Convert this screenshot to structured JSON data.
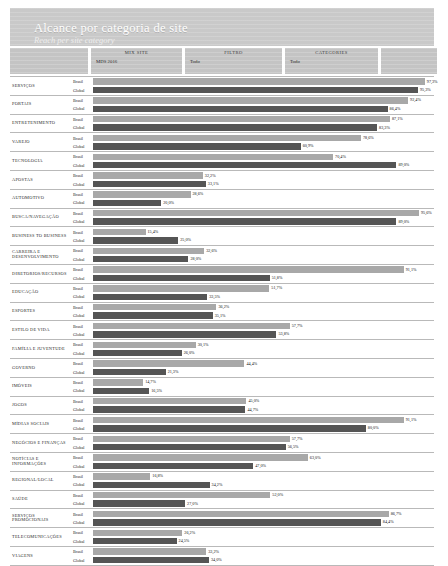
{
  "header": {
    "title": "Alcance por categoria de site",
    "subtitle": "Reach per site category"
  },
  "filters": [
    {
      "label": "",
      "value": ""
    },
    {
      "label": "MIX Site",
      "value": "MDS 2016"
    },
    {
      "label": "FILTRO",
      "value": "Todo"
    },
    {
      "label": "CATEGORIES",
      "value": "Todo"
    },
    {
      "label": "",
      "value": ""
    }
  ],
  "series_names": {
    "brasil": "Brasil",
    "global": "Global"
  },
  "colors": {
    "brasil": "#a8a8a8",
    "global": "#555555",
    "header": "#c9c9c9",
    "filter": "#c4c4c4"
  },
  "chart_data": {
    "type": "bar",
    "title": "Alcance por categoria de site",
    "subtitle": "Reach per site category",
    "orientation": "horizontal",
    "xlabel": "",
    "ylabel": "",
    "xlim": [
      0,
      100
    ],
    "grid": false,
    "legend": [
      "Brasil",
      "Global"
    ],
    "categories": [
      "SERVIÇOS",
      "PORTAIS",
      "ENTRETENIMENTO",
      "VAREJO",
      "TECNOLOGIA",
      "APOSTAS",
      "AUTOMOTIVO",
      "BUSCA/NAVEGAÇÃO",
      "BUSINESS TO BUSINESS",
      "CARREIRA E DESENVOLVIMENTO",
      "DIRETORIOS/RECURSOS",
      "EDUCAÇÃO",
      "ESPORTES",
      "ESTILO DE VIDA",
      "FAMÍLIA E JUVENTUDE",
      "GOVERNO",
      "IMÓVEIS",
      "JOGOS",
      "MÍDIAS SOCIAIS",
      "NEGÓCIOS E FINANÇAS",
      "NOTÍCIAS E INFORMAÇÕES",
      "REGIONAL/LOCAL",
      "SAÚDE",
      "SERVIÇOS PROMOCIONAIS",
      "TELECOMUNICAÇÕES",
      "VIAGENS"
    ],
    "series": [
      {
        "name": "Brasil",
        "values": [
          97.3,
          92.4,
          87.1,
          78.6,
          70.4,
          32.2,
          28.6,
          95.6,
          15.4,
          32.6,
          91.1,
          51.7,
          36.2,
          57.7,
          30.1,
          44.4,
          14.7,
          45.0,
          91.1,
          57.7,
          63.0,
          16.8,
          52.0,
          86.7,
          26.2,
          33.2
        ],
        "color": "#a8a8a8"
      },
      {
        "name": "Global",
        "values": [
          95.3,
          86.4,
          83.3,
          60.9,
          89.0,
          33.1,
          20.0,
          89.0,
          25.0,
          28.0,
          51.8,
          33.5,
          35.1,
          53.8,
          26.0,
          21.3,
          16.5,
          44.7,
          80.0,
          56.5,
          47.0,
          34.2,
          27.0,
          84.4,
          24.5,
          34.0
        ],
        "color": "#555555"
      }
    ],
    "data_labels": [
      {
        "category": "SERVIÇOS",
        "brasil": "97,3%",
        "global": "95,3%"
      },
      {
        "category": "PORTAIS",
        "brasil": "92,4%",
        "global": "86,4%"
      },
      {
        "category": "ENTRETENIMENTO",
        "brasil": "87,1%",
        "global": "83,3%"
      },
      {
        "category": "VAREJO",
        "brasil": "78,6%",
        "global": "60,9%"
      },
      {
        "category": "TECNOLOGIA",
        "brasil": "70,4%",
        "global": "89,0%"
      },
      {
        "category": "APOSTAS",
        "brasil": "32,2%",
        "global": "33,1%"
      },
      {
        "category": "AUTOMOTIVO",
        "brasil": "28,6%",
        "global": "20,0%"
      },
      {
        "category": "BUSCA/NAVEGAÇÃO",
        "brasil": "95,6%",
        "global": "89,0%"
      },
      {
        "category": "BUSINESS TO BUSINESS",
        "brasil": "15,4%",
        "global": "25,0%"
      },
      {
        "category": "CARREIRA E DESENVOLVIMENTO",
        "brasil": "32,6%",
        "global": "28,0%"
      },
      {
        "category": "DIRETORIOS/RECURSOS",
        "brasil": "91,1%",
        "global": "51,8%"
      },
      {
        "category": "EDUCAÇÃO",
        "brasil": "51,7%",
        "global": "33,5%"
      },
      {
        "category": "ESPORTES",
        "brasil": "36,2%",
        "global": "35,1%"
      },
      {
        "category": "ESTILO DE VIDA",
        "brasil": "57,7%",
        "global": "53,8%"
      },
      {
        "category": "FAMÍLIA E JUVENTUDE",
        "brasil": "30,1%",
        "global": "26,0%"
      },
      {
        "category": "GOVERNO",
        "brasil": "44,4%",
        "global": "21,3%"
      },
      {
        "category": "IMÓVEIS",
        "brasil": "14,7%",
        "global": "16,5%"
      },
      {
        "category": "JOGOS",
        "brasil": "45,0%",
        "global": "44,7%"
      },
      {
        "category": "MÍDIAS SOCIAIS",
        "brasil": "91,1%",
        "global": "80,0%"
      },
      {
        "category": "NEGÓCIOS E FINANÇAS",
        "brasil": "57,7%",
        "global": "56,5%"
      },
      {
        "category": "NOTÍCIAS E INFORMAÇÕES",
        "brasil": "63,0%",
        "global": "47,0%"
      },
      {
        "category": "REGIONAL/LOCAL",
        "brasil": "16,8%",
        "global": "34,2%"
      },
      {
        "category": "SAÚDE",
        "brasil": "52,0%",
        "global": "27,0%"
      },
      {
        "category": "SERVIÇOS PROMOCIONAIS",
        "brasil": "86,7%",
        "global": "84,4%"
      },
      {
        "category": "TELECOMUNICAÇÕES",
        "brasil": "26,2%",
        "global": "24,5%"
      },
      {
        "category": "VIAGENS",
        "brasil": "33,2%",
        "global": "34,0%"
      }
    ]
  }
}
